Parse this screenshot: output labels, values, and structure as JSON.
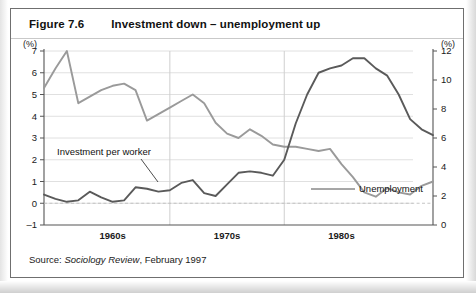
{
  "figure": {
    "number": "Figure 7.6",
    "title": "Investment down – unemployment up",
    "source_prefix": "Source:",
    "source_italic": "Sociology Review",
    "source_rest": ", February 1997"
  },
  "chart_data": {
    "type": "line",
    "title": "Investment down – unemployment up",
    "xlabel": "",
    "ylabel": "(%)",
    "y2label": "(%)",
    "grid": true,
    "legend": "in-plot annotations",
    "left_axis": {
      "unit": "(%)",
      "ticks": [
        -1,
        0,
        1,
        2,
        3,
        4,
        5,
        6,
        7
      ],
      "ylim": [
        -1,
        7
      ],
      "series": "Investment per worker"
    },
    "right_axis": {
      "unit": "(%)",
      "ticks": [
        0,
        2,
        4,
        6,
        8,
        10,
        12
      ],
      "ylim": [
        0,
        12
      ],
      "series": "Unemployment"
    },
    "x_tick_labels": [
      "1960s",
      "1970s",
      "1980s"
    ],
    "x_range": [
      1959,
      1993
    ],
    "decade_dividers": [
      1970,
      1980
    ],
    "annotations": [
      {
        "text": "Investment per worker",
        "series": "investment"
      },
      {
        "text": "Unemployment",
        "series": "unemployment"
      }
    ],
    "series": [
      {
        "name": "Investment per worker",
        "axis": "left",
        "color": "#9a9a9a",
        "x": [
          1959,
          1960,
          1961,
          1962,
          1963,
          1964,
          1965,
          1966,
          1967,
          1968,
          1969,
          1970,
          1971,
          1972,
          1973,
          1974,
          1975,
          1976,
          1977,
          1978,
          1979,
          1980,
          1981,
          1982,
          1983,
          1984,
          1985,
          1986,
          1987,
          1988,
          1989,
          1990,
          1991,
          1992,
          1993
        ],
        "values": [
          5.3,
          6.2,
          7.0,
          4.6,
          4.9,
          5.2,
          5.4,
          5.5,
          5.2,
          3.8,
          4.1,
          4.4,
          4.7,
          5.0,
          4.6,
          3.7,
          3.2,
          3.0,
          3.4,
          3.1,
          2.7,
          2.6,
          2.6,
          2.5,
          2.4,
          2.5,
          1.8,
          1.2,
          0.5,
          0.3,
          0.7,
          0.5,
          0.4,
          0.8,
          1.0
        ]
      },
      {
        "name": "Unemployment",
        "axis": "right",
        "color": "#5a5a5a",
        "x": [
          1959,
          1960,
          1961,
          1962,
          1963,
          1964,
          1965,
          1966,
          1967,
          1968,
          1969,
          1970,
          1971,
          1972,
          1973,
          1974,
          1975,
          1976,
          1977,
          1978,
          1979,
          1980,
          1981,
          1982,
          1983,
          1984,
          1985,
          1986,
          1987,
          1988,
          1989,
          1990,
          1991,
          1992,
          1993
        ],
        "values": [
          2.1,
          1.8,
          1.6,
          1.7,
          2.3,
          1.9,
          1.6,
          1.7,
          2.6,
          2.5,
          2.3,
          2.4,
          2.9,
          3.1,
          2.2,
          2.0,
          2.8,
          3.6,
          3.7,
          3.6,
          3.4,
          4.5,
          7.0,
          9.0,
          10.5,
          10.8,
          11.0,
          11.5,
          11.5,
          10.8,
          10.3,
          9.0,
          7.3,
          6.6,
          6.2
        ]
      }
    ]
  }
}
